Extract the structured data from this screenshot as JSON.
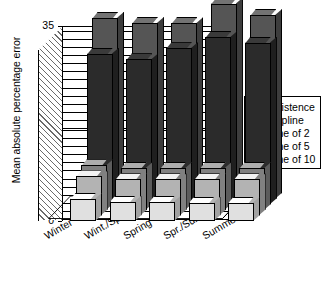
{
  "chart_data": {
    "type": "bar",
    "subtype": "3d-grouped-bar",
    "title": "",
    "xlabel": "",
    "ylabel": "Mean absolute percentage error",
    "ylim": [
      0,
      35
    ],
    "yticks": [
      0,
      5,
      10,
      15,
      20,
      25,
      30,
      35
    ],
    "ytick_labels": [
      "0",
      "5",
      "10",
      "15",
      "20",
      "25",
      "30",
      "35"
    ],
    "grid": true,
    "grid_axis": "y",
    "legend_position": "right",
    "categories": [
      "Winter",
      "Wint./Spr.",
      "Spring",
      "Spr./Sum.",
      "Summer"
    ],
    "series": [
      {
        "name": "Persistence",
        "color": "#555555",
        "values": [
          32.5,
          31.5,
          31.5,
          35.0,
          33.0
        ]
      },
      {
        "name": "No spline",
        "color": "#2b2b2b",
        "values": [
          27.0,
          26.0,
          28.0,
          30.0,
          29.0
        ]
      },
      {
        "name": "Spline of 2",
        "color": "#808080",
        "values": [
          8.0,
          7.5,
          7.5,
          7.5,
          7.5
        ]
      },
      {
        "name": "Spline of 5",
        "color": "#b3b3b3",
        "values": [
          7.0,
          6.5,
          6.5,
          6.5,
          6.5
        ]
      },
      {
        "name": "Spline of 10",
        "color": "#e0e0e0",
        "values": [
          4.0,
          3.5,
          3.5,
          3.3,
          3.3
        ]
      }
    ]
  },
  "axes": {
    "y_title": "Mean absolute percentage error",
    "y_tick_labels": [
      "35",
      "30",
      "25",
      "20",
      "15",
      "10",
      "5",
      "0"
    ],
    "x_tick_labels": [
      "Winter",
      "Wint./Spr.",
      "Spring",
      "Spr./Sum.",
      "Summer"
    ]
  },
  "legend": {
    "items": [
      {
        "label": "Persistence",
        "color": "#555555"
      },
      {
        "label": "No spline",
        "color": "#2b2b2b"
      },
      {
        "label": "Spline of 2",
        "color": "#808080"
      },
      {
        "label": "Spline of 5",
        "color": "#b3b3b3"
      },
      {
        "label": "Spline of 10",
        "color": "#f2f2f2"
      }
    ]
  }
}
